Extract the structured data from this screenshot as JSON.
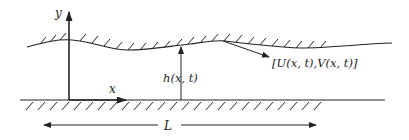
{
  "diagram": {
    "type": "channel-flow-schematic",
    "axes": {
      "y_label": "y",
      "x_label": "x"
    },
    "labels": {
      "height": "h(x, t)",
      "velocity": "[U(x, t),V(x, t)]",
      "length": "L"
    },
    "elements": [
      "upper wavy wall (hatched)",
      "lower flat wall (hatched)",
      "y-axis arrow",
      "x-axis arrow",
      "height arrow h(x,t)",
      "velocity pointer [U(x,t),V(x,t)]",
      "length dimension L (double arrow)"
    ],
    "colors": {
      "stroke": "#222222",
      "background": "#ffffff"
    }
  }
}
